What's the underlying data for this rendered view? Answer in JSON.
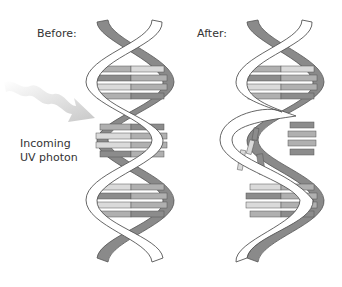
{
  "labels": {
    "before": "Before:",
    "after": "After:",
    "photon_line1": "Incoming",
    "photon_line2": "UV photon"
  },
  "colors": {
    "background": "#ffffff",
    "front_strand": "#ffffff",
    "back_strand": "#8a8a8a",
    "outline": "#555555",
    "base_dark": "#8c8c8c",
    "base_mid": "#b0b0b0",
    "base_light": "#dadada",
    "photon_arrow": "#cfcfcf"
  },
  "diagram": {
    "helices": [
      {
        "name": "before-helix",
        "state": "intact"
      },
      {
        "name": "after-helix",
        "state": "damaged",
        "damage_region": "middle turn, base pairs broken"
      }
    ],
    "arrow": {
      "from": "upper-left",
      "to": "before-helix middle",
      "style": "wavy"
    }
  }
}
